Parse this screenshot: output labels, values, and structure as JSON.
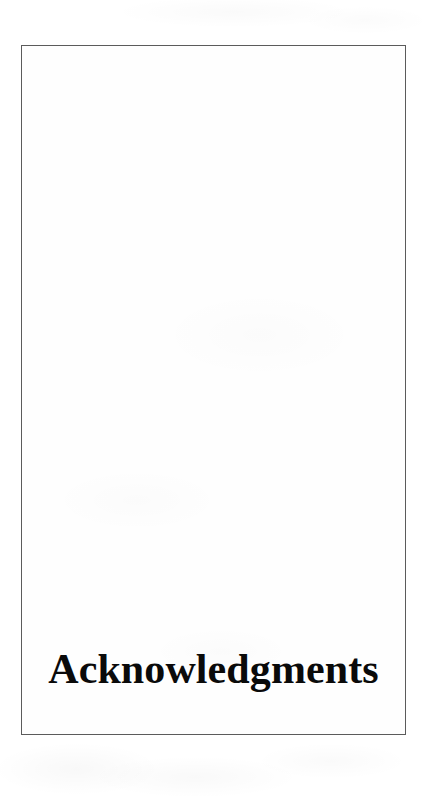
{
  "document": {
    "kind": "scanned-book-page",
    "page_type": "chapter-opening-page",
    "background_color": "#ffffff",
    "paper_color": "#fefefe"
  },
  "page_frame": {
    "name": "printed-page-border",
    "border_color": "#5b5b5b",
    "border_width_px": 1.4,
    "left_px": 21,
    "top_px": 45,
    "width_px": 385,
    "height_px": 690
  },
  "content": {
    "chapter_heading": "Acknowledgments",
    "heading_color": "#0a0a0a",
    "heading_font_size_px": 42,
    "heading_weight": "bold",
    "heading_alignment": "center",
    "heading_baseline_y_px": 645
  }
}
